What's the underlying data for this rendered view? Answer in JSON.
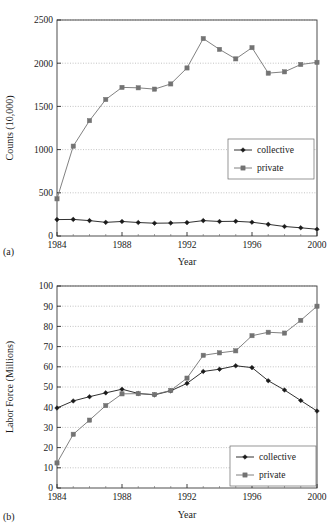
{
  "figure": {
    "panels": [
      {
        "tag": "(a)",
        "chart_data": {
          "type": "line",
          "title": "",
          "xlabel": "Year",
          "ylabel": "Counts (10,000)",
          "xlim": [
            1984,
            2000
          ],
          "ylim": [
            0,
            2500
          ],
          "xticks": [
            1984,
            1988,
            1992,
            1996,
            2000
          ],
          "xticklabels": [
            "1984",
            "1988",
            "1992",
            "1996",
            "2000"
          ],
          "yticks": [
            0,
            500,
            1000,
            1500,
            2000,
            2500
          ],
          "yticklabels": [
            "0",
            "500",
            "1000",
            "1500",
            "2000",
            "2500"
          ],
          "grid": "horizontal-dotted",
          "legend_position": "center-right",
          "x": [
            1984,
            1985,
            1986,
            1987,
            1988,
            1989,
            1990,
            1991,
            1992,
            1993,
            1994,
            1995,
            1996,
            1997,
            1998,
            1999,
            2000
          ],
          "series": [
            {
              "name": "collective",
              "color": "#1a1a1a",
              "marker": "diamond",
              "values": [
                190,
                192,
                178,
                158,
                168,
                156,
                148,
                150,
                155,
                178,
                168,
                170,
                160,
                135,
                110,
                95,
                78
              ]
            },
            {
              "name": "private",
              "color": "#737373",
              "marker": "square",
              "values": [
                430,
                1040,
                1335,
                1580,
                1720,
                1715,
                1700,
                1760,
                1945,
                2285,
                2160,
                2050,
                2180,
                1885,
                1900,
                1985,
                2010
              ]
            }
          ]
        }
      },
      {
        "tag": "(b)",
        "chart_data": {
          "type": "line",
          "title": "",
          "xlabel": "Year",
          "ylabel": "Labor Force (Millions)",
          "xlim": [
            1984,
            2000
          ],
          "ylim": [
            0,
            100
          ],
          "xticks": [
            1984,
            1988,
            1992,
            1996,
            2000
          ],
          "xticklabels": [
            "1984",
            "1988",
            "1992",
            "1996",
            "2000"
          ],
          "yticks": [
            0,
            10,
            20,
            30,
            40,
            50,
            60,
            70,
            80,
            90,
            100
          ],
          "yticklabels": [
            "0",
            "10",
            "20",
            "30",
            "40",
            "50",
            "60",
            "70",
            "80",
            "90",
            "100"
          ],
          "grid": "horizontal-dotted",
          "legend_position": "bottom-right",
          "x": [
            1984,
            1985,
            1986,
            1987,
            1988,
            1989,
            1990,
            1991,
            1992,
            1993,
            1994,
            1995,
            1996,
            1997,
            1998,
            1999,
            2000
          ],
          "series": [
            {
              "name": "collective",
              "color": "#1a1a1a",
              "marker": "diamond",
              "values": [
                39.6,
                43.1,
                45.2,
                47.1,
                48.9,
                46.8,
                46.1,
                48.1,
                51.8,
                57.7,
                58.8,
                60.5,
                59.6,
                53.1,
                48.5,
                43.3,
                38.1
              ]
            },
            {
              "name": "private",
              "color": "#737373",
              "marker": "square",
              "values": [
                12.4,
                26.6,
                33.6,
                40.8,
                46.6,
                46.7,
                46.3,
                48.3,
                54.4,
                65.7,
                66.9,
                67.9,
                75.4,
                77.1,
                76.7,
                83.0,
                90.0
              ]
            }
          ]
        }
      }
    ]
  }
}
